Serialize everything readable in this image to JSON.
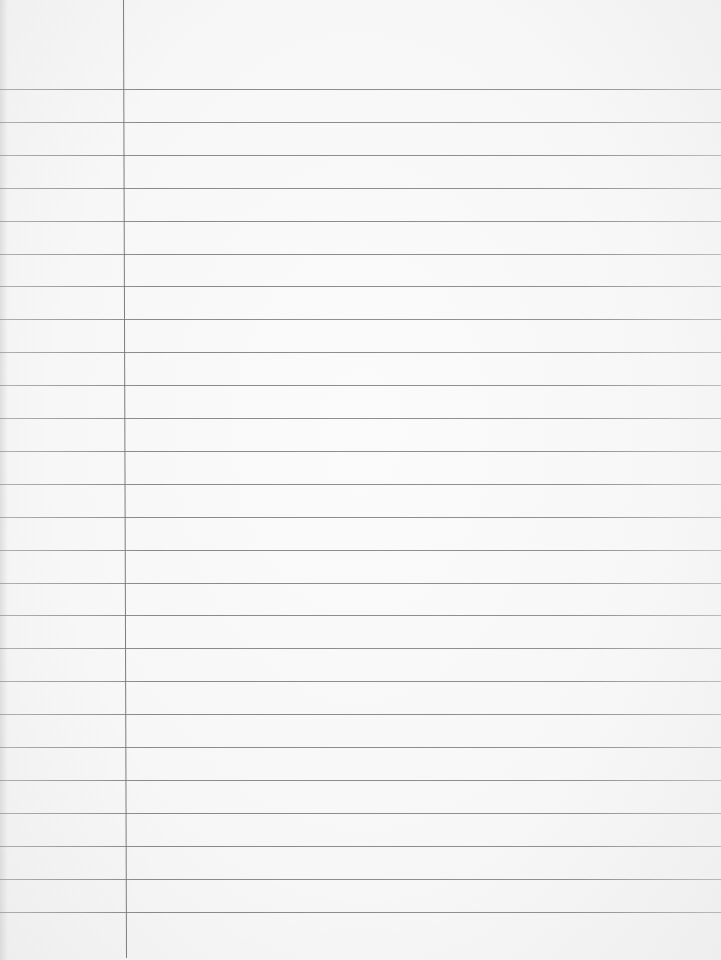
{
  "page": {
    "type": "lined-paper",
    "background_color": "#f7f7f7",
    "rule_color": "#7a7a7a",
    "margin_line_color": "#7d7d7d"
  },
  "margin_line": {
    "x": 123,
    "top": 0,
    "bottom": 958
  },
  "rules": {
    "first_y": 89,
    "spacing": 32.9,
    "count": 26
  }
}
